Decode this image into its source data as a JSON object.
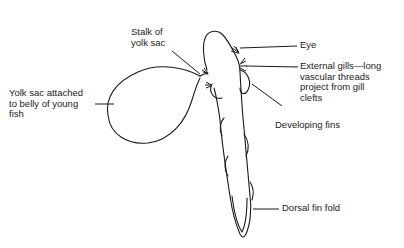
{
  "diagram": {
    "labels": [
      {
        "id": "stalk",
        "text": "Stalk of\nyolk sac"
      },
      {
        "id": "yolk_sac",
        "text": "Yolk sac attached\nto belly of young\nfish"
      },
      {
        "id": "eye",
        "text": "Eye"
      },
      {
        "id": "gills",
        "text": "External gills—long\nvascular threads\nproject from gill\nclefts"
      },
      {
        "id": "fins",
        "text": "Developing fins"
      },
      {
        "id": "dorsal",
        "text": "Dorsal fin fold"
      }
    ],
    "colors": {
      "line": "#1a1a1a",
      "text": "#222222",
      "background": "#ffffff"
    }
  }
}
